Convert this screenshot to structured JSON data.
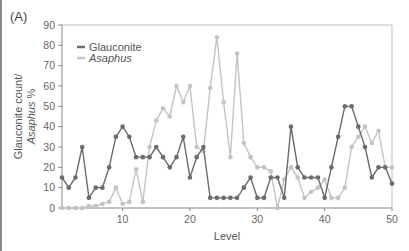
{
  "panel_label": "(A)",
  "chart_data": {
    "type": "line",
    "title": "",
    "xlabel": "Level",
    "ylabel_line1": "Glauconite count/",
    "ylabel_line2": "Asaphus %",
    "xlim": [
      1,
      50
    ],
    "ylim": [
      0,
      90
    ],
    "x_ticks": [
      10,
      20,
      30,
      40,
      50
    ],
    "y_ticks": [
      0,
      10,
      20,
      30,
      40,
      50,
      60,
      70,
      80,
      90
    ],
    "grid": false,
    "legend_position": "upper-left",
    "x": [
      1,
      2,
      3,
      4,
      5,
      6,
      7,
      8,
      9,
      10,
      11,
      12,
      13,
      14,
      15,
      16,
      17,
      18,
      19,
      20,
      21,
      22,
      23,
      24,
      25,
      26,
      27,
      28,
      29,
      30,
      31,
      32,
      33,
      34,
      35,
      36,
      37,
      38,
      39,
      40,
      41,
      42,
      43,
      44,
      45,
      46,
      47,
      48,
      49,
      50
    ],
    "series": [
      {
        "name": "Glauconite",
        "italic": false,
        "color": "#6b6b6b",
        "values": [
          15,
          10,
          15,
          30,
          5,
          10,
          10,
          20,
          35,
          40,
          35,
          25,
          25,
          25,
          30,
          25,
          20,
          25,
          35,
          15,
          25,
          30,
          5,
          5,
          5,
          5,
          5,
          10,
          15,
          5,
          5,
          15,
          15,
          5,
          40,
          20,
          15,
          15,
          15,
          5,
          20,
          35,
          50,
          50,
          40,
          30,
          15,
          20,
          20,
          12
        ]
      },
      {
        "name": "Asaphus",
        "italic": true,
        "color": "#c4c4c4",
        "values": [
          0,
          0,
          0,
          0,
          1,
          1,
          2,
          3,
          10,
          2,
          3,
          19,
          3,
          30,
          43,
          49,
          45,
          60,
          52,
          60,
          30,
          28,
          59,
          84,
          52,
          25,
          76,
          32,
          25,
          20,
          20,
          18,
          0,
          14,
          20,
          15,
          5,
          8,
          10,
          14,
          5,
          5,
          10,
          30,
          35,
          40,
          32,
          38,
          20,
          20
        ]
      }
    ]
  }
}
